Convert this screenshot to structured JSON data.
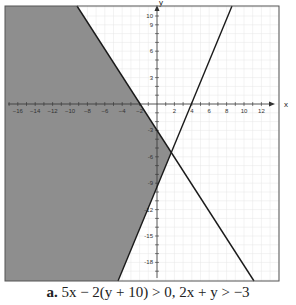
{
  "chart_data": {
    "type": "line",
    "title": "",
    "caption_label": "a.",
    "caption_expr": "5x − 2(y + 10) > 0, 2x + y > −3",
    "xlabel": "x",
    "ylabel": "y",
    "xlim": [
      -17.5,
      14
    ],
    "ylim": [
      -20,
      11
    ],
    "grid": true,
    "x_ticks": [
      -16,
      -14,
      -12,
      -10,
      -8,
      -6,
      -4,
      -2,
      2,
      4,
      6,
      8,
      10,
      12
    ],
    "y_ticks": [
      10,
      9,
      6,
      3,
      -3,
      -6,
      -9,
      -12,
      -15,
      -18
    ],
    "y_tick_labels": [
      "10",
      "9",
      "6",
      "3",
      "-3",
      "-6",
      "-9",
      "-12",
      "-15",
      "-18"
    ],
    "series": [
      {
        "name": "5x − 2(y + 10) = 0",
        "points": [
          [
            -3.8,
            -20
          ],
          [
            8.6,
            11
          ]
        ],
        "color": "#1a1a1a"
      },
      {
        "name": "2x + y = −3",
        "points": [
          [
            -9.2,
            11
          ],
          [
            11.0,
            -20
          ]
        ],
        "color": "#1a1a1a"
      }
    ],
    "intersection": [
      1.6,
      -5.6
    ],
    "shaded_region": {
      "color": "#8e8e8e",
      "description": "region left of both boundary lines",
      "vertices": [
        [
          -17.5,
          11
        ],
        [
          -9.2,
          11
        ],
        [
          1.6,
          -5.6
        ],
        [
          -3.8,
          -20
        ],
        [
          -17.5,
          -20
        ]
      ]
    },
    "colors": {
      "shade": "#8e8e8e",
      "grid": "#e4e4e4",
      "frame": "#555555",
      "line": "#1a1a1a"
    }
  }
}
